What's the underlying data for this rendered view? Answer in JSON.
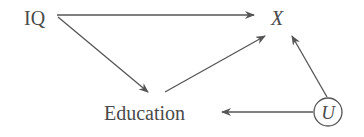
{
  "diagram": {
    "type": "causal-dag",
    "nodes": [
      {
        "id": "iq",
        "label": "IQ",
        "italic": false,
        "circled": false
      },
      {
        "id": "x",
        "label": "X",
        "italic": true,
        "circled": false
      },
      {
        "id": "education",
        "label": "Education",
        "italic": false,
        "circled": false
      },
      {
        "id": "u",
        "label": "U",
        "italic": true,
        "circled": true
      }
    ],
    "edges": [
      {
        "from": "IQ",
        "to": "X"
      },
      {
        "from": "IQ",
        "to": "Education"
      },
      {
        "from": "Education",
        "to": "X"
      },
      {
        "from": "U",
        "to": "X"
      },
      {
        "from": "U",
        "to": "Education"
      }
    ],
    "colors": {
      "ink": "#4a4a4a",
      "edge": "#555555",
      "background": "#ffffff"
    }
  }
}
